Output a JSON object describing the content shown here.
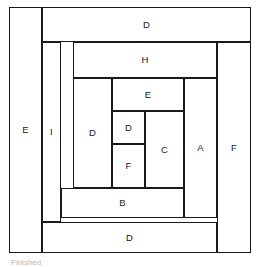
{
  "diagram": {
    "caption": "Finished",
    "canvas": {
      "width": 257,
      "height": 267
    },
    "line_color": "#1a1a1a",
    "fill_color": "#ffffff",
    "frame": {
      "x": 9,
      "y": 7,
      "w": 242,
      "h": 246
    },
    "patches": [
      {
        "id": "patch-e-left",
        "label": "E",
        "x": 9,
        "y": 7,
        "w": 33,
        "h": 246
      },
      {
        "id": "patch-d-top",
        "label": "D",
        "x": 42,
        "y": 7,
        "w": 209,
        "h": 35
      },
      {
        "id": "patch-f-right",
        "label": "F",
        "x": 217,
        "y": 42,
        "w": 34,
        "h": 211
      },
      {
        "id": "patch-d-bottom",
        "label": "D",
        "x": 42,
        "y": 222,
        "w": 175,
        "h": 31
      },
      {
        "id": "patch-i",
        "label": "I",
        "x": 42,
        "y": 42,
        "w": 19,
        "h": 180
      },
      {
        "id": "patch-h",
        "label": "H",
        "x": 73,
        "y": 42,
        "w": 144,
        "h": 36
      },
      {
        "id": "patch-a",
        "label": "A",
        "x": 184,
        "y": 78,
        "w": 33,
        "h": 140
      },
      {
        "id": "patch-b",
        "label": "B",
        "x": 61,
        "y": 188,
        "w": 123,
        "h": 30
      },
      {
        "id": "patch-d-left",
        "label": "D",
        "x": 73,
        "y": 78,
        "w": 39,
        "h": 110
      },
      {
        "id": "patch-e-inner",
        "label": "E",
        "x": 112,
        "y": 78,
        "w": 72,
        "h": 33
      },
      {
        "id": "patch-c",
        "label": "C",
        "x": 145,
        "y": 111,
        "w": 39,
        "h": 77
      },
      {
        "id": "patch-d-small",
        "label": "D",
        "x": 112,
        "y": 111,
        "w": 33,
        "h": 33
      },
      {
        "id": "patch-f-small",
        "label": "F",
        "x": 112,
        "y": 144,
        "w": 33,
        "h": 44
      }
    ]
  }
}
